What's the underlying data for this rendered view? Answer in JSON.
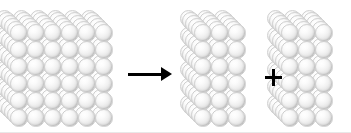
{
  "figure": {
    "background_color": "#ffffff",
    "sphere_color": "#eeeeee",
    "sphere_edge_color": "#c4c4c4",
    "operator_color": "#000000",
    "border_color": "#e8e8e8",
    "width": 351,
    "height": 133
  },
  "blocks": [
    {
      "id": "block-whole",
      "label": "whole cube",
      "columns": 6,
      "rows": 6,
      "depth": 6,
      "sphere_count": 216,
      "origin_x": 10,
      "origin_y": 24,
      "sphere_size": 17.5,
      "step_x": 17.0,
      "step_y": 17.0,
      "depth_dx": -2.9,
      "depth_dy": -2.9
    },
    {
      "id": "block-half-left",
      "label": "half cube left",
      "columns": 3,
      "rows": 6,
      "depth": 6,
      "sphere_count": 108,
      "origin_x": 194,
      "origin_y": 24,
      "sphere_size": 17.5,
      "step_x": 17.0,
      "step_y": 17.0,
      "depth_dx": -2.9,
      "depth_dy": -2.9
    },
    {
      "id": "block-half-right",
      "label": "half cube right",
      "columns": 3,
      "rows": 6,
      "depth": 6,
      "sphere_count": 108,
      "origin_x": 281,
      "origin_y": 24,
      "sphere_size": 17.5,
      "step_x": 17.0,
      "step_y": 17.0,
      "depth_dx": -2.9,
      "depth_dy": -2.9
    }
  ],
  "operators": {
    "arrow": {
      "symbol": "→",
      "name": "yields",
      "x": 128,
      "y": 67,
      "length": 44,
      "thickness": 3,
      "head_width": 11,
      "head_height": 7
    },
    "plus": {
      "symbol": "+",
      "name": "plus",
      "x": 265,
      "y": 69,
      "arm_length": 17,
      "thickness": 3
    }
  }
}
